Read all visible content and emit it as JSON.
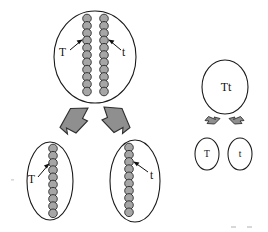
{
  "diagram": {
    "type": "biology-segregation-diagram",
    "background_color": "#ffffff",
    "bead_fill": "#a6a6a6",
    "bead_stroke": "#2b2b2b",
    "outline_stroke": "#1a1a1a",
    "arrow_fill": "#8f8f8f",
    "arrow_stroke": "#2e2e2e"
  },
  "left_panel": {
    "name": "chromosome-view",
    "parent_cell": {
      "name": "parent-cell",
      "cx": 95,
      "cy": 57,
      "rx": 41,
      "ry": 46,
      "chromosomes": [
        {
          "allele": "T",
          "bead_count": 11,
          "x": 87,
          "top": 18,
          "spacing": 7.3
        },
        {
          "allele": "t",
          "bead_count": 11,
          "x": 104,
          "top": 18,
          "spacing": 7.3
        }
      ],
      "labels": [
        {
          "text": "T",
          "x": 63,
          "y": 53
        },
        {
          "text": "t",
          "x": 124,
          "y": 53
        }
      ]
    },
    "daughter_cells": [
      {
        "name": "daughter-cell-T",
        "allele": "T",
        "cx": 50,
        "cy": 181,
        "rx": 23,
        "ry": 39,
        "chromosome": {
          "x": 53,
          "top": 148,
          "bead_count": 10,
          "spacing": 7.2
        },
        "label": {
          "text": "T",
          "x": 32,
          "y": 180
        }
      },
      {
        "name": "daughter-cell-t",
        "allele": "t",
        "cx": 135,
        "cy": 181,
        "rx": 25,
        "ry": 41,
        "chromosome": {
          "x": 129,
          "top": 147,
          "bead_count": 10,
          "spacing": 7.2
        },
        "label": {
          "text": "t",
          "x": 152,
          "y": 176
        }
      }
    ],
    "arrows": [
      {
        "name": "division-arrow-left",
        "direction": "down-left"
      },
      {
        "name": "division-arrow-right",
        "direction": "down-right"
      }
    ]
  },
  "right_panel": {
    "name": "genotype-view",
    "parent_cell": {
      "name": "parent-genotype-cell",
      "label": "Tt",
      "cx": 225,
      "cy": 87,
      "rx": 23,
      "ry": 27
    },
    "gamete_cells": [
      {
        "name": "gamete-cell-T",
        "label": "T",
        "cx": 207,
        "cy": 154,
        "rx": 12,
        "ry": 16
      },
      {
        "name": "gamete-cell-t",
        "label": "t",
        "cx": 240,
        "cy": 154,
        "rx": 12,
        "ry": 16
      }
    ],
    "arrows": [
      {
        "name": "gamete-arrow-left",
        "direction": "down-left"
      },
      {
        "name": "gamete-arrow-right",
        "direction": "down-right"
      }
    ]
  }
}
